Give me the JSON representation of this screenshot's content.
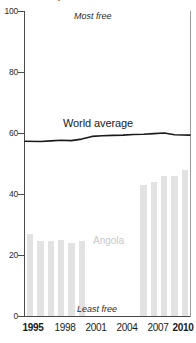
{
  "chart_data": {
    "type": "bar",
    "title": "",
    "xlabel": "",
    "ylabel": "",
    "ylim": [
      0,
      100
    ],
    "xlim": [
      1995,
      2010
    ],
    "grid": false,
    "legend_position": "inline-annotation",
    "x": [
      1995,
      1996,
      1997,
      1998,
      1999,
      2000,
      2001,
      2002,
      2003,
      2004,
      2005,
      2006,
      2007,
      2008,
      2009,
      2010
    ],
    "y_ticks": [
      0,
      20,
      40,
      60,
      80,
      100
    ],
    "x_ticks": [
      1995,
      1998,
      2001,
      2004,
      2007,
      2010
    ],
    "x_tick_labels": [
      "1995",
      "1998",
      "2001",
      "2004",
      "2007",
      "2010"
    ],
    "x_tick_bold": [
      true,
      false,
      false,
      false,
      false,
      true
    ],
    "series": [
      {
        "name": "Angola",
        "type": "bar",
        "color": "#e2e2e2",
        "label_color": "#c9c9c9",
        "values": [
          27,
          24.5,
          24.5,
          24.8,
          23.8,
          24.5,
          null,
          null,
          null,
          null,
          null,
          43,
          44,
          46,
          46,
          48
        ]
      },
      {
        "name": "World average",
        "type": "line",
        "color": "#1a1a1a",
        "values": [
          57.3,
          57.2,
          57.4,
          57.6,
          57.5,
          58.0,
          58.9,
          59.1,
          59.2,
          59.3,
          59.5,
          59.6,
          59.8,
          60.0,
          59.4,
          59.3
        ]
      }
    ],
    "annotations": [
      {
        "id": "most-free",
        "text": "Most free",
        "style": "italic",
        "position": "top-center"
      },
      {
        "id": "least-free",
        "text": "Least free",
        "style": "italic",
        "position": "bottom-center"
      },
      {
        "id": "angola",
        "text": "Angola",
        "style": "normal",
        "position": "inline"
      },
      {
        "id": "world-average",
        "text": "World average",
        "style": "normal",
        "position": "inline"
      }
    ]
  },
  "labels": {
    "most_free": "Most free",
    "least_free": "Least free",
    "angola": "Angola",
    "world_average": "World average"
  },
  "axis": {
    "y": {
      "t0": "0",
      "t20": "20",
      "t40": "40",
      "t60": "60",
      "t80": "80",
      "t100": "100"
    },
    "x": {
      "t1995": "1995",
      "t1998": "1998",
      "t2001": "2001",
      "t2004": "2004",
      "t2007": "2007",
      "t2010": "2010"
    }
  },
  "colors": {
    "bar": "#e2e2e2",
    "line": "#1a1a1a",
    "axis": "#4a4a4a",
    "angola_label": "#c9c9c9"
  }
}
